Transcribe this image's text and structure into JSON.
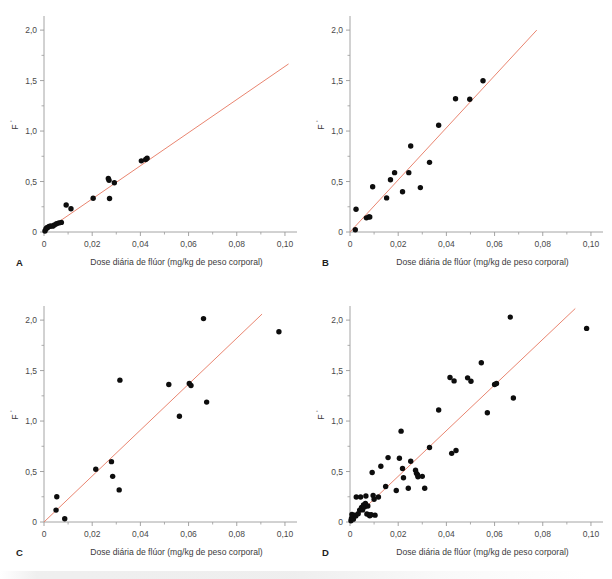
{
  "figure": {
    "background": "#ffffff",
    "fit_line_color": "#e98570",
    "point_color": "#0d0d0d",
    "axis_color": "#9a9a9a"
  },
  "axis": {
    "xlabel": "Dose diária de flúor (mg/kg de peso corporal)",
    "ylabel_base": "F",
    "ylabel_sup": "°",
    "xticks": [
      "0",
      "0,02",
      "0,04",
      "0,06",
      "0,08",
      "0,10"
    ],
    "xtick_values": [
      0,
      0.02,
      0.04,
      0.06,
      0.08,
      0.1
    ],
    "yticks": [
      "0",
      "0,5",
      "1,0",
      "1,5",
      "2,0"
    ],
    "ytick_values": [
      0,
      0.5,
      1.0,
      1.5,
      2.0
    ],
    "xlim": [
      0,
      0.105
    ],
    "ylim": [
      0,
      2.12
    ]
  },
  "chart_data": [
    {
      "type": "scatter",
      "panel": "A",
      "title": "",
      "xlabel": "Dose diária de flúor (mg/kg de peso corporal)",
      "ylabel": "F°",
      "xlim": [
        0,
        0.105
      ],
      "ylim": [
        0,
        2.12
      ],
      "grid": false,
      "legend": "none",
      "points": [
        [
          0.0004,
          0.01
        ],
        [
          0.0008,
          0.03
        ],
        [
          0.0011,
          0.04
        ],
        [
          0.0015,
          0.045
        ],
        [
          0.0021,
          0.055
        ],
        [
          0.0028,
          0.06
        ],
        [
          0.0036,
          0.058
        ],
        [
          0.0043,
          0.07
        ],
        [
          0.0052,
          0.082
        ],
        [
          0.0062,
          0.09
        ],
        [
          0.0072,
          0.095
        ],
        [
          0.0092,
          0.268
        ],
        [
          0.0112,
          0.23
        ],
        [
          0.0204,
          0.335
        ],
        [
          0.0267,
          0.53
        ],
        [
          0.027,
          0.512
        ],
        [
          0.0272,
          0.332
        ],
        [
          0.0292,
          0.488
        ],
        [
          0.0404,
          0.705
        ],
        [
          0.0422,
          0.718
        ],
        [
          0.0428,
          0.73
        ]
      ],
      "fit_line": {
        "x0": 0.0,
        "y0": 0.0,
        "x1": 0.1015,
        "y1": 1.665
      }
    },
    {
      "type": "scatter",
      "panel": "B",
      "title": "",
      "xlabel": "Dose diária de flúor (mg/kg de peso corporal)",
      "ylabel": "F°",
      "xlim": [
        0,
        0.105
      ],
      "ylim": [
        0,
        2.12
      ],
      "grid": false,
      "legend": "none",
      "points": [
        [
          0.0022,
          0.022
        ],
        [
          0.0025,
          0.225
        ],
        [
          0.0068,
          0.14
        ],
        [
          0.0078,
          0.15
        ],
        [
          0.0082,
          0.148
        ],
        [
          0.0094,
          0.448
        ],
        [
          0.0152,
          0.338
        ],
        [
          0.0168,
          0.518
        ],
        [
          0.0185,
          0.588
        ],
        [
          0.0218,
          0.398
        ],
        [
          0.0244,
          0.588
        ],
        [
          0.0252,
          0.852
        ],
        [
          0.0292,
          0.44
        ],
        [
          0.033,
          0.69
        ],
        [
          0.0368,
          1.058
        ],
        [
          0.0438,
          1.32
        ],
        [
          0.0497,
          1.315
        ],
        [
          0.0552,
          1.498
        ]
      ],
      "fit_line": {
        "x0": 0.0,
        "y0": 0.0,
        "x1": 0.0775,
        "y1": 2.0
      }
    },
    {
      "type": "scatter",
      "panel": "C",
      "title": "",
      "xlabel": "Dose diária de flúor (mg/kg de peso corporal)",
      "ylabel": "F°",
      "xlim": [
        0,
        0.105
      ],
      "ylim": [
        0,
        2.12
      ],
      "grid": false,
      "legend": "none",
      "points": [
        [
          0.005,
          0.118
        ],
        [
          0.0053,
          0.25
        ],
        [
          0.0086,
          0.032
        ],
        [
          0.0215,
          0.522
        ],
        [
          0.028,
          0.598
        ],
        [
          0.0285,
          0.452
        ],
        [
          0.0312,
          0.318
        ],
        [
          0.0315,
          1.405
        ],
        [
          0.0518,
          1.362
        ],
        [
          0.0562,
          1.048
        ],
        [
          0.0603,
          1.372
        ],
        [
          0.061,
          1.352
        ],
        [
          0.0662,
          2.015
        ],
        [
          0.0675,
          1.188
        ],
        [
          0.0975,
          1.885
        ]
      ],
      "fit_line": {
        "x0": 0.0,
        "y0": 0.0,
        "x1": 0.0905,
        "y1": 2.06
      }
    },
    {
      "type": "scatter",
      "panel": "D",
      "title": "",
      "xlabel": "Dose diária de flúor (mg/kg de peso corporal)",
      "ylabel": "F°",
      "xlim": [
        0,
        0.105
      ],
      "ylim": [
        0,
        2.12
      ],
      "grid": false,
      "legend": "none",
      "points": [
        [
          0.0004,
          0.012
        ],
        [
          0.0006,
          0.035
        ],
        [
          0.0008,
          0.075
        ],
        [
          0.001,
          0.048
        ],
        [
          0.0014,
          0.028
        ],
        [
          0.002,
          0.068
        ],
        [
          0.0024,
          0.06
        ],
        [
          0.0026,
          0.248
        ],
        [
          0.0034,
          0.082
        ],
        [
          0.004,
          0.118
        ],
        [
          0.0044,
          0.248
        ],
        [
          0.0048,
          0.145
        ],
        [
          0.0052,
          0.12
        ],
        [
          0.0056,
          0.168
        ],
        [
          0.006,
          0.148
        ],
        [
          0.0064,
          0.185
        ],
        [
          0.0066,
          0.258
        ],
        [
          0.007,
          0.08
        ],
        [
          0.0074,
          0.158
        ],
        [
          0.0078,
          0.072
        ],
        [
          0.0082,
          0.062
        ],
        [
          0.0088,
          0.072
        ],
        [
          0.0092,
          0.49
        ],
        [
          0.0096,
          0.262
        ],
        [
          0.01,
          0.225
        ],
        [
          0.0104,
          0.068
        ],
        [
          0.0118,
          0.248
        ],
        [
          0.0128,
          0.552
        ],
        [
          0.0148,
          0.352
        ],
        [
          0.0158,
          0.638
        ],
        [
          0.0192,
          0.312
        ],
        [
          0.0205,
          0.632
        ],
        [
          0.0212,
          0.9
        ],
        [
          0.0218,
          0.53
        ],
        [
          0.0222,
          0.438
        ],
        [
          0.0242,
          0.335
        ],
        [
          0.0252,
          0.602
        ],
        [
          0.0272,
          0.512
        ],
        [
          0.0276,
          0.482
        ],
        [
          0.028,
          0.468
        ],
        [
          0.0282,
          0.448
        ],
        [
          0.03,
          0.452
        ],
        [
          0.031,
          0.335
        ],
        [
          0.033,
          0.738
        ],
        [
          0.0368,
          1.11
        ],
        [
          0.0415,
          1.432
        ],
        [
          0.0422,
          0.68
        ],
        [
          0.0432,
          1.398
        ],
        [
          0.044,
          0.708
        ],
        [
          0.0488,
          1.428
        ],
        [
          0.0502,
          1.395
        ],
        [
          0.0545,
          1.578
        ],
        [
          0.057,
          1.082
        ],
        [
          0.06,
          1.362
        ],
        [
          0.0608,
          1.372
        ],
        [
          0.0665,
          2.03
        ],
        [
          0.0678,
          1.228
        ],
        [
          0.0982,
          1.918
        ]
      ],
      "fit_line": {
        "x0": 0.0,
        "y0": 0.0,
        "x1": 0.0935,
        "y1": 2.115
      }
    }
  ],
  "panels": [
    {
      "letter": "A"
    },
    {
      "letter": "B"
    },
    {
      "letter": "C"
    },
    {
      "letter": "D"
    }
  ]
}
